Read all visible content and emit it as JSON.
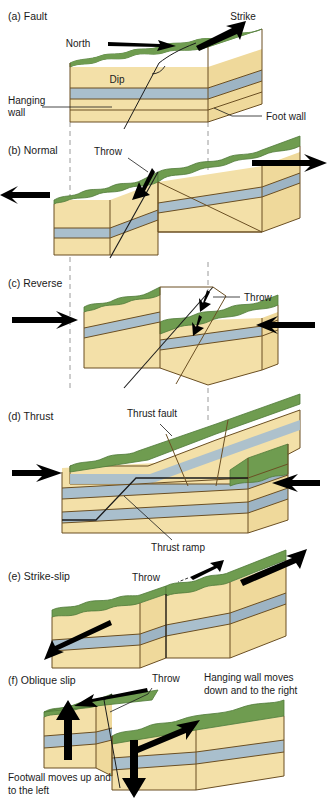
{
  "figure": {
    "background": "#ffffff"
  },
  "colors": {
    "sandstone": "#f3e0a8",
    "sandstone_side": "#efd99b",
    "shale_band": "#a9bfcd",
    "shale_band_side": "#9db4c4",
    "grass_top": "#6f9c50",
    "grass_dark": "#5c8a42",
    "outline": "#6b4f23",
    "arrow": "#000000",
    "leader": "#000000",
    "dashed_guide": "#9a9a9a",
    "text": "#1a1a1a"
  },
  "guides": {
    "left_x": 70,
    "right_x": 208,
    "style": "dashed",
    "label": "vertical reference guides"
  },
  "panels": [
    {
      "id": "a",
      "label": "(a) Fault",
      "annotations": [
        {
          "name": "strike",
          "text": "Strike"
        },
        {
          "name": "north",
          "text": "North"
        },
        {
          "name": "dip",
          "text": "Dip"
        },
        {
          "name": "hanging-wall",
          "text": "Hanging\nwall"
        },
        {
          "name": "hanging-wall-line1",
          "text": "Hanging"
        },
        {
          "name": "hanging-wall-line2",
          "text": "wall"
        },
        {
          "name": "foot-wall",
          "text": "Foot wall"
        }
      ]
    },
    {
      "id": "b",
      "label": "(b) Normal",
      "annotations": [
        {
          "name": "throw",
          "text": "Throw"
        }
      ],
      "arrows": [
        "left-extension",
        "right-extension"
      ]
    },
    {
      "id": "c",
      "label": "(c) Reverse",
      "annotations": [
        {
          "name": "throw",
          "text": "Throw"
        }
      ],
      "arrows": [
        "left-compression",
        "right-compression"
      ]
    },
    {
      "id": "d",
      "label": "(d) Thrust",
      "annotations": [
        {
          "name": "thrust-fault",
          "text": "Thrust fault"
        },
        {
          "name": "thrust-ramp",
          "text": "Thrust ramp"
        }
      ],
      "arrows": [
        "left-compression",
        "right-compression"
      ]
    },
    {
      "id": "e",
      "label": "(e) Strike-slip",
      "annotations": [
        {
          "name": "throw",
          "text": "Throw"
        }
      ],
      "arrows": [
        "near-block-left",
        "far-block-right"
      ]
    },
    {
      "id": "f",
      "label": "(f) Oblique slip",
      "annotations": [
        {
          "name": "throw",
          "text": "Throw"
        },
        {
          "name": "hanging-wall-note-line1",
          "text": "Hanging wall moves"
        },
        {
          "name": "hanging-wall-note-line2",
          "text": "down and to the right"
        },
        {
          "name": "footwall-note-line1",
          "text": "Footwall moves up and"
        },
        {
          "name": "footwall-note-line2",
          "text": "to the left"
        }
      ],
      "arrows": [
        "up-arrow",
        "down-arrow",
        "left-block-slip",
        "right-block-slip"
      ]
    }
  ]
}
